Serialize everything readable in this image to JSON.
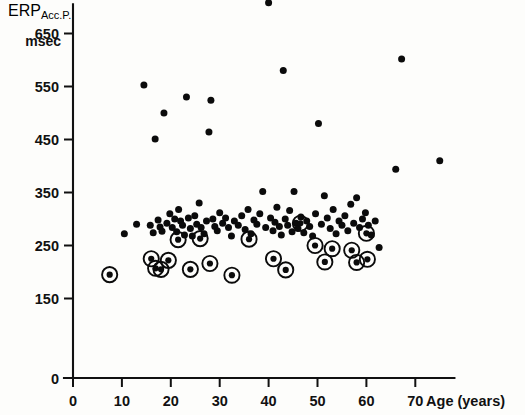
{
  "figure": {
    "background_color": "#fdfdfb",
    "ink_color": "#0b0b0b"
  },
  "labels": {
    "y_axis_main": "ERP",
    "y_axis_sub": "Acc.P.",
    "y_axis_unit": "msec",
    "x_axis_title": "Age (years)",
    "x_axis_title_number": "70"
  },
  "chart_data": {
    "type": "scatter",
    "title": "",
    "xlabel": "Age (years)",
    "ylabel": "ERP Acc.P. msec",
    "xlim": [
      0,
      78
    ],
    "ylim": [
      0,
      720
    ],
    "grid": false,
    "legend_position": "none",
    "xticks": [
      0,
      10,
      20,
      30,
      40,
      50,
      60,
      70
    ],
    "xtick_labels": [
      "0",
      "10",
      "20",
      "30",
      "40",
      "50",
      "60",
      "70"
    ],
    "yticks": [
      0,
      150,
      250,
      350,
      450,
      550,
      650
    ],
    "ytick_labels": [
      "0",
      "150",
      "250",
      "350",
      "450",
      "550",
      "650"
    ],
    "series": [
      {
        "name": "plain",
        "marker": "filled-dot",
        "points": [
          [
            10.5,
            272
          ],
          [
            13.0,
            290
          ],
          [
            14.5,
            553
          ],
          [
            15.8,
            288
          ],
          [
            16.4,
            274
          ],
          [
            16.8,
            451
          ],
          [
            17.4,
            298
          ],
          [
            17.8,
            285
          ],
          [
            18.2,
            277
          ],
          [
            18.6,
            500
          ],
          [
            19.2,
            292
          ],
          [
            19.8,
            310
          ],
          [
            20.3,
            284
          ],
          [
            20.8,
            300
          ],
          [
            21.2,
            276
          ],
          [
            21.6,
            318
          ],
          [
            22.0,
            296
          ],
          [
            22.4,
            288
          ],
          [
            22.8,
            270
          ],
          [
            23.2,
            530
          ],
          [
            23.6,
            302
          ],
          [
            24.0,
            282
          ],
          [
            24.4,
            268
          ],
          [
            24.9,
            306
          ],
          [
            25.3,
            290
          ],
          [
            25.8,
            330
          ],
          [
            26.2,
            284
          ],
          [
            26.8,
            272
          ],
          [
            27.3,
            296
          ],
          [
            27.8,
            464
          ],
          [
            28.2,
            524
          ],
          [
            28.6,
            300
          ],
          [
            29.0,
            286
          ],
          [
            29.5,
            278
          ],
          [
            30.0,
            312
          ],
          [
            30.6,
            292
          ],
          [
            31.2,
            302
          ],
          [
            31.8,
            284
          ],
          [
            32.4,
            268
          ],
          [
            33.0,
            296
          ],
          [
            33.8,
            288
          ],
          [
            34.5,
            306
          ],
          [
            35.2,
            280
          ],
          [
            35.8,
            318
          ],
          [
            36.4,
            272
          ],
          [
            37.0,
            298
          ],
          [
            37.6,
            290
          ],
          [
            38.2,
            310
          ],
          [
            38.8,
            352
          ],
          [
            39.4,
            284
          ],
          [
            40.0,
            708
          ],
          [
            40.4,
            302
          ],
          [
            40.9,
            278
          ],
          [
            41.3,
            294
          ],
          [
            41.7,
            322
          ],
          [
            42.2,
            286
          ],
          [
            42.6,
            270
          ],
          [
            43.0,
            580
          ],
          [
            43.4,
            300
          ],
          [
            43.9,
            288
          ],
          [
            44.3,
            316
          ],
          [
            44.8,
            276
          ],
          [
            45.2,
            352
          ],
          [
            45.6,
            292
          ],
          [
            46.0,
            282
          ],
          [
            46.6,
            304
          ],
          [
            47.2,
            274
          ],
          [
            47.8,
            296
          ],
          [
            48.4,
            286
          ],
          [
            49.0,
            268
          ],
          [
            49.6,
            310
          ],
          [
            50.2,
            480
          ],
          [
            50.8,
            290
          ],
          [
            51.4,
            344
          ],
          [
            52.0,
            302
          ],
          [
            52.6,
            282
          ],
          [
            53.2,
            318
          ],
          [
            53.8,
            272
          ],
          [
            54.4,
            296
          ],
          [
            55.0,
            288
          ],
          [
            55.6,
            306
          ],
          [
            56.2,
            278
          ],
          [
            56.8,
            328
          ],
          [
            57.4,
            292
          ],
          [
            58.0,
            340
          ],
          [
            58.6,
            284
          ],
          [
            59.2,
            300
          ],
          [
            59.8,
            312
          ],
          [
            60.4,
            288
          ],
          [
            61.0,
            270
          ],
          [
            61.8,
            296
          ],
          [
            62.6,
            246
          ],
          [
            66.0,
            394
          ],
          [
            67.2,
            602
          ],
          [
            75.0,
            410
          ]
        ]
      },
      {
        "name": "ringed",
        "marker": "dot-with-ring",
        "points": [
          [
            7.5,
            195
          ],
          [
            16.0,
            225
          ],
          [
            16.9,
            207
          ],
          [
            18.0,
            205
          ],
          [
            19.5,
            222
          ],
          [
            21.5,
            261
          ],
          [
            24.0,
            205
          ],
          [
            26.0,
            263
          ],
          [
            28.0,
            216
          ],
          [
            32.5,
            194
          ],
          [
            36.0,
            262
          ],
          [
            41.0,
            225
          ],
          [
            43.5,
            204
          ],
          [
            46.5,
            292
          ],
          [
            49.5,
            250
          ],
          [
            51.5,
            219
          ],
          [
            53.0,
            244
          ],
          [
            57.0,
            241
          ],
          [
            58.0,
            218
          ],
          [
            60.0,
            273
          ],
          [
            60.2,
            224
          ]
        ]
      }
    ]
  }
}
